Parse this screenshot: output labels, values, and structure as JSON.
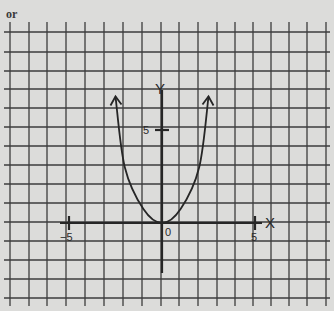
{
  "page_label": "or",
  "colors": {
    "paper": "#dcdcda",
    "grid": "#3c3c3c",
    "ink": "#262626"
  },
  "axes": {
    "x_label": "X",
    "y_label": "Y",
    "x_ticks": [
      {
        "value": -5,
        "label": "−5"
      },
      {
        "value": 5,
        "label": "5"
      }
    ],
    "y_ticks": [
      {
        "value": 5,
        "label": "5"
      }
    ],
    "origin_label": "0"
  },
  "chart_data": {
    "type": "line",
    "title": "",
    "xlabel": "X",
    "ylabel": "Y",
    "function": "y = x^2 (parabola, vertex at origin, opening upward)",
    "x": [
      -2.5,
      -2,
      -1,
      0,
      1,
      2,
      2.5
    ],
    "y": [
      6.8,
      3,
      0.75,
      0,
      0.75,
      3,
      6.8
    ],
    "xlim": [
      -8,
      9
    ],
    "ylim": [
      -4,
      11
    ],
    "tick_labels": {
      "x": [
        "-5",
        "0",
        "5"
      ],
      "y": [
        "5"
      ]
    },
    "grid": true,
    "grid_spacing": 1,
    "arrows_on_curve_ends": true,
    "legend": null
  }
}
